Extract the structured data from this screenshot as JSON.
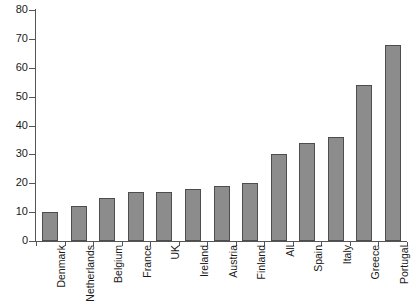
{
  "chart_data": {
    "type": "bar",
    "title": "",
    "subtitle": "",
    "xlabel": "",
    "ylabel": "",
    "ylim": [
      0,
      80
    ],
    "ytick_step": 10,
    "yticks": [
      0,
      10,
      20,
      30,
      40,
      50,
      60,
      70,
      80
    ],
    "ytick_labels": [
      "0",
      "10",
      "20",
      "30",
      "40",
      "50",
      "60",
      "70",
      "80"
    ],
    "grid": false,
    "legend": null,
    "legend_position": "none",
    "categories": [
      "Denmark",
      "Netherlands",
      "Belgium",
      "France",
      "UK",
      "Ireland",
      "Austria",
      "Finland",
      "All",
      "Spain",
      "Italy",
      "Greece",
      "Portugal"
    ],
    "values": [
      10,
      12,
      15,
      17,
      17,
      18,
      19,
      20,
      30,
      34,
      36,
      54,
      68
    ],
    "series": [
      {
        "name": "",
        "values": [
          10,
          12,
          15,
          17,
          17,
          18,
          19,
          20,
          30,
          34,
          36,
          54,
          68
        ]
      }
    ],
    "bar_color": "#8c8c8c",
    "bar_border_color": "#4d4d4d",
    "axis_color": "#555555",
    "text_color": "#1a1a1a",
    "annotations": []
  }
}
